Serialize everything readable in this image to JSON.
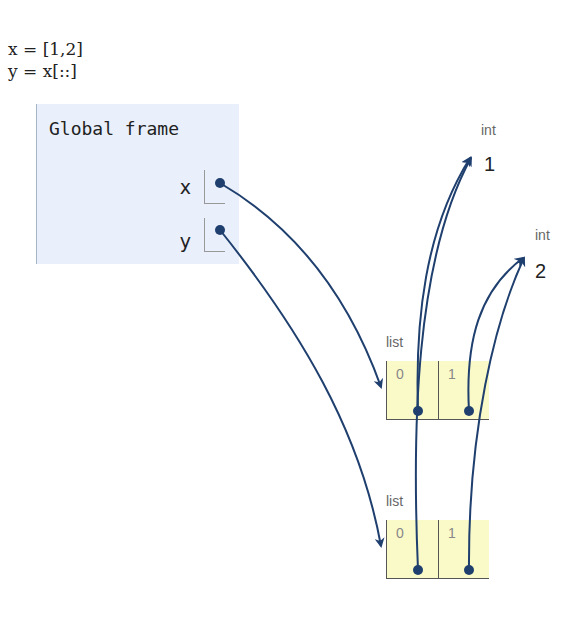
{
  "code": {
    "lines": [
      "x = [1,2]",
      "y = x[::]"
    ]
  },
  "frame": {
    "title": "Global frame",
    "variables": [
      {
        "name": "x",
        "points_to": "list_1"
      },
      {
        "name": "y",
        "points_to": "list_2"
      }
    ]
  },
  "objects": {
    "int_1": {
      "type": "int",
      "value": "1"
    },
    "int_2": {
      "type": "int",
      "value": "2"
    },
    "list_1": {
      "type": "list",
      "indices": [
        "0",
        "1"
      ],
      "points_to": [
        "int_1",
        "int_2"
      ]
    },
    "list_2": {
      "type": "list",
      "indices": [
        "0",
        "1"
      ],
      "points_to": [
        "int_1",
        "int_2"
      ]
    }
  },
  "colors": {
    "arrow": "#1f3f6e",
    "frame_bg": "#e9f0fb",
    "list_bg": "#fafac8"
  }
}
